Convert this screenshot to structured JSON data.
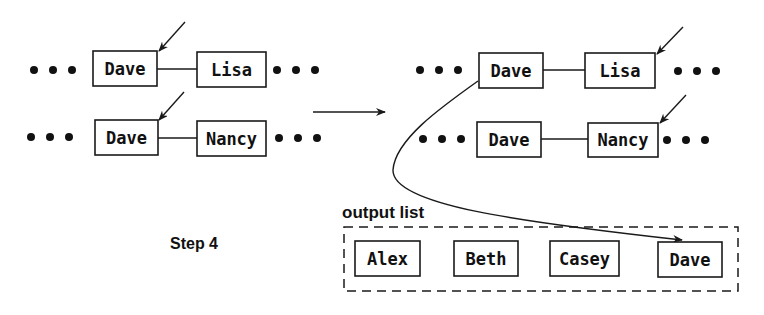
{
  "diagram": {
    "step_label": "Step 4",
    "output_list_label": "output list",
    "left_state": {
      "row1": {
        "left": "Dave",
        "right": "Lisa",
        "pointer_on": "Dave"
      },
      "row2": {
        "left": "Dave",
        "right": "Nancy",
        "pointer_on": "Dave"
      }
    },
    "right_state": {
      "row1": {
        "left": "Dave",
        "right": "Lisa",
        "pointer_on": "Lisa"
      },
      "row2": {
        "left": "Dave",
        "right": "Nancy",
        "pointer_on": "Nancy"
      }
    },
    "output_list": [
      "Alex",
      "Beth",
      "Casey",
      "Dave"
    ],
    "moved_item": "Dave"
  }
}
